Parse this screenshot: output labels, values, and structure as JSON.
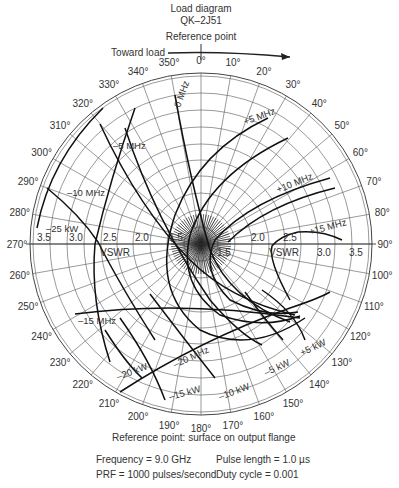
{
  "header": {
    "title_line1": "Load diagram",
    "title_line2": "QK–2J51",
    "reference_label": "Reference point",
    "toward_load_label": "Toward load"
  },
  "footer": {
    "reference_note": "Reference point:  surface on output flange",
    "frequency": "Frequency = 9.0 GHz",
    "pulse_length": "Pulse length = 1.0 µs",
    "prf": "PRF = 1000 pulses/second",
    "duty_cycle": "Duty cycle = 0.001"
  },
  "chart_data": {
    "type": "polar-load-diagram",
    "title": "Load diagram QK–2J51",
    "angle_ticks_deg": [
      0,
      10,
      20,
      30,
      40,
      50,
      60,
      70,
      80,
      90,
      100,
      110,
      120,
      130,
      140,
      150,
      160,
      170,
      180,
      190,
      200,
      210,
      220,
      230,
      240,
      250,
      260,
      270,
      280,
      290,
      300,
      310,
      320,
      330,
      340,
      350
    ],
    "angle_tick_labels": [
      "0°",
      "10°",
      "20°",
      "30°",
      "40°",
      "50°",
      "60°",
      "70°",
      "80°",
      "90°",
      "100°",
      "110°",
      "120°",
      "130°",
      "140°",
      "150°",
      "160°",
      "170°",
      "180°",
      "190°",
      "200°",
      "210°",
      "220°",
      "230°",
      "240°",
      "250°",
      "260°",
      "270°",
      "280°",
      "290°",
      "300°",
      "310°",
      "320°",
      "330°",
      "340°",
      "350°"
    ],
    "vswr_axis_label": "VSWR",
    "vswr_ticks": [
      "1.5",
      "2.0",
      "2.5",
      "3.0",
      "3.5"
    ],
    "frequency_contours": [
      "0 MHz",
      "+5 MHz",
      "+10 MHz",
      "+15 MHz",
      "–5 MHz",
      "–10 MHz",
      "–15 MHz",
      "–20 MHz"
    ],
    "power_contours": [
      "+5 kW",
      "–5 kW",
      "–10 kW",
      "–15 kW",
      "–20 kW",
      "–25 kW"
    ],
    "rotation_direction": "Toward load (clockwise)",
    "grid": true
  }
}
